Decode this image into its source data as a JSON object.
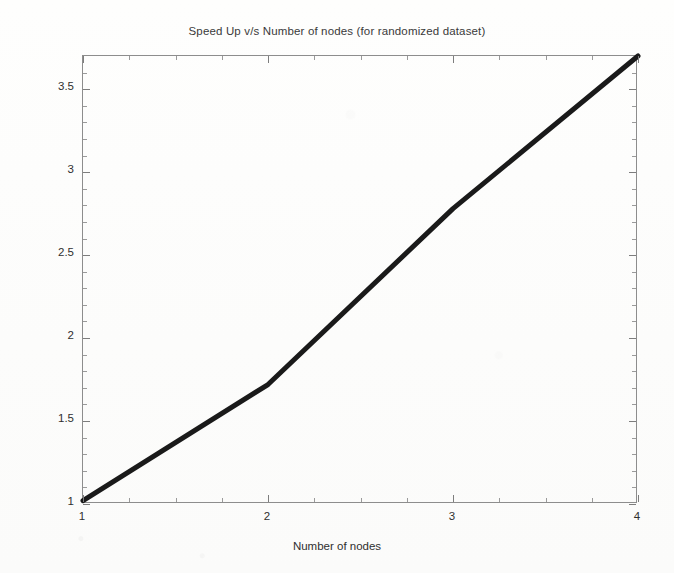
{
  "figure": {
    "background_color": "#fdfdfc",
    "axis_color": "#8d8d8d",
    "line_color": "#1a1a1a",
    "text_color": "#2f2f2f"
  },
  "chart_data": {
    "type": "line",
    "title": "Speed Up v/s Number of nodes (for randomized dataset)",
    "xlabel": "Number of nodes",
    "ylabel": "Speed Up",
    "x": [
      1,
      2,
      3,
      4
    ],
    "values": [
      1.02,
      1.72,
      2.78,
      3.7
    ],
    "series": [
      {
        "name": "Speed Up",
        "x": [
          1,
          2,
          3,
          4
        ],
        "values": [
          1.02,
          1.72,
          2.78,
          3.7
        ]
      }
    ],
    "xlim": [
      1,
      4
    ],
    "ylim": [
      1,
      3.7
    ],
    "xticks": [
      1,
      2,
      3,
      4
    ],
    "xticklabels": [
      "1",
      "2",
      "3",
      "4"
    ],
    "yticks": [
      1,
      1.5,
      2,
      2.5,
      3,
      3.5
    ],
    "yticklabels": [
      "1",
      "1.5",
      "2",
      "2.5",
      "3",
      "3.5"
    ],
    "x_minor_ticks": [
      1.25,
      1.5,
      1.75,
      2.25,
      2.5,
      2.75,
      3.25,
      3.5,
      3.75
    ],
    "y_minor_ticks": [
      1.1,
      1.2,
      1.3,
      1.4,
      1.6,
      1.7,
      1.8,
      1.9,
      2.1,
      2.2,
      2.3,
      2.4,
      2.6,
      2.7,
      2.8,
      2.9,
      3.1,
      3.2,
      3.3,
      3.4,
      3.6
    ],
    "grid": false,
    "legend": false,
    "line_width_px": 5
  }
}
